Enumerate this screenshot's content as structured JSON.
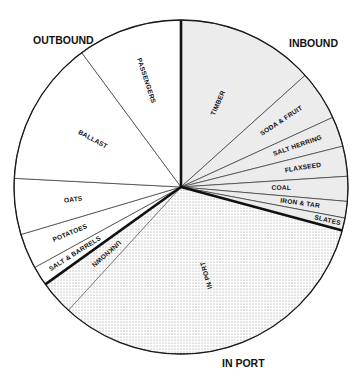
{
  "chart_data": {
    "type": "pie",
    "title": "",
    "start_angle_deg": 90,
    "direction": "clockwise",
    "groups": [
      {
        "name": "INBOUND",
        "fill": "#ececec",
        "pattern": "solid-light-gray"
      },
      {
        "name": "IN PORT",
        "fill": "#ffffff",
        "pattern": "stipple-dots"
      },
      {
        "name": "OUTBOUND",
        "fill": "#ffffff",
        "pattern": "none"
      }
    ],
    "slices": [
      {
        "label": "TIMBER",
        "group": "INBOUND",
        "value": 13.3
      },
      {
        "label": "SODA & FRUIT",
        "group": "INBOUND",
        "value": 4.8
      },
      {
        "label": "SALT HERRING",
        "group": "INBOUND",
        "value": 2.9
      },
      {
        "label": "FLAXSEED",
        "group": "INBOUND",
        "value": 2.9
      },
      {
        "label": "COAL",
        "group": "INBOUND",
        "value": 2.4
      },
      {
        "label": "IRON & TAR",
        "group": "INBOUND",
        "value": 1.6
      },
      {
        "label": "SLATES",
        "group": "INBOUND",
        "value": 1.2
      },
      {
        "label": "IN PORT",
        "group": "IN PORT",
        "value": 32.5
      },
      {
        "label": "UNKNOWN",
        "group": "IN PORT",
        "value": 3.3
      },
      {
        "label": "SALT & BARRELS",
        "group": "OUTBOUND",
        "value": 1.9
      },
      {
        "label": "POTATOES",
        "group": "OUTBOUND",
        "value": 3.4
      },
      {
        "label": "OATS",
        "group": "OUTBOUND",
        "value": 5.4
      },
      {
        "label": "BALLAST",
        "group": "OUTBOUND",
        "value": 14.0
      },
      {
        "label": "PASSENGERS",
        "group": "OUTBOUND",
        "value": 10.1
      }
    ],
    "annotations": [
      "OUTBOUND",
      "INBOUND",
      "IN PORT"
    ],
    "legend": "none",
    "value_units": "percent (estimated from slice angles)"
  },
  "labels": {
    "outbound": "OUTBOUND",
    "inbound": "INBOUND",
    "in_port": "IN PORT"
  },
  "colors": {
    "inbound_fill": "#ececec",
    "outline": "#1a1a1a",
    "dot": "#8a8a8a"
  }
}
